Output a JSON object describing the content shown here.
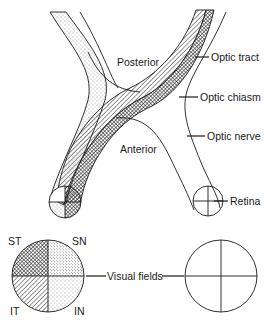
{
  "diagram": {
    "regions": {
      "posterior": "Posterior",
      "anterior": "Anterior"
    },
    "structures": {
      "optic_tract": "Optic tract",
      "optic_chiasm": "Optic chiasm",
      "optic_nerve": "Optic nerve",
      "retina": "Retina",
      "visual_fields": "Visual fields"
    },
    "quadrants": {
      "superior_temporal": "ST",
      "superior_nasal": "SN",
      "inferior_temporal": "IT",
      "inferior_nasal": "IN"
    },
    "legend_patterns": {
      "ST": "cross-hatched dark",
      "SN": "dense stipple",
      "IT": "diagonal hatching",
      "IN": "light stipple"
    },
    "colors": {
      "ink": "#1a1a1a",
      "background": "#ffffff"
    }
  }
}
